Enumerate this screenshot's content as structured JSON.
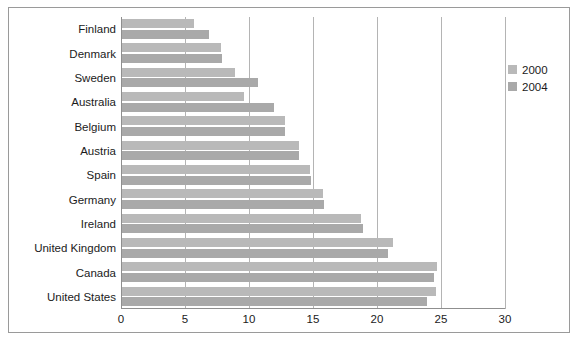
{
  "chart_data": {
    "type": "bar",
    "orientation": "horizontal",
    "title": "",
    "subtitle": "",
    "xlabel": "",
    "ylabel": "",
    "xlim": [
      0,
      30
    ],
    "xticks": [
      0,
      5,
      10,
      15,
      20,
      25,
      30
    ],
    "xtick_labels": [
      "0",
      "5",
      "10",
      "15",
      "20",
      "25",
      "30"
    ],
    "grid": true,
    "grid_axis": "x",
    "legend_position": "right",
    "categories": [
      "Finland",
      "Denmark",
      "Sweden",
      "Australia",
      "Belgium",
      "Austria",
      "Spain",
      "Germany",
      "Ireland",
      "United Kingdom",
      "Canada",
      "United States"
    ],
    "series": [
      {
        "name": "2000",
        "color": "#b9b9b9",
        "values": [
          5.6,
          7.7,
          8.8,
          9.5,
          12.7,
          13.8,
          14.7,
          15.7,
          18.7,
          21.2,
          24.6,
          24.5
        ]
      },
      {
        "name": "2004",
        "color": "#a9a9a9",
        "values": [
          6.8,
          7.8,
          10.6,
          11.9,
          12.7,
          13.8,
          14.8,
          15.8,
          18.8,
          20.8,
          24.4,
          23.8
        ]
      }
    ]
  },
  "legend": {
    "entries": [
      {
        "label": "2000",
        "color": "#b9b9b9"
      },
      {
        "label": "2004",
        "color": "#a9a9a9"
      }
    ]
  },
  "style": {
    "frame_color": "#9a9a9a",
    "grid_color": "#b4b4b4",
    "axis_color": "#8f8f8f",
    "text_color": "#1b1b1b",
    "background": "#ffffff"
  }
}
